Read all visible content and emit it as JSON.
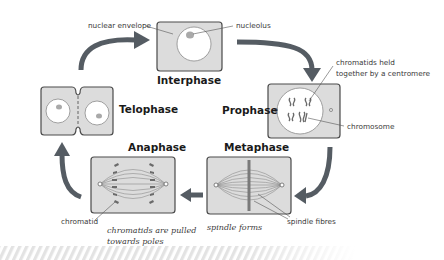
{
  "diagram": {
    "stages": [
      {
        "id": "interphase",
        "label": "Interphase"
      },
      {
        "id": "prophase",
        "label": "Prophase"
      },
      {
        "id": "metaphase",
        "label": "Metaphase"
      },
      {
        "id": "anaphase",
        "label": "Anaphase"
      },
      {
        "id": "telophase",
        "label": "Telophase"
      }
    ],
    "annotations": {
      "nuclear_envelope": "nuclear envelope",
      "nucleolus": "nucleolus",
      "chromatids_held_line1": "chromatids held",
      "chromatids_held_line2": "together by a centromere",
      "chromosome": "chromosome",
      "spindle_fibres": "spindle fibres",
      "spindle_forms": "spindle forms",
      "chromatid": "chromatid",
      "pulled_line1": "chromatids are pulled",
      "pulled_line2": "towards poles"
    },
    "colors": {
      "cell_fill": "#dcdcdc",
      "cell_stroke": "#4a4a4a",
      "arrow": "#555c63",
      "stripe": "#e6e6e6"
    }
  }
}
